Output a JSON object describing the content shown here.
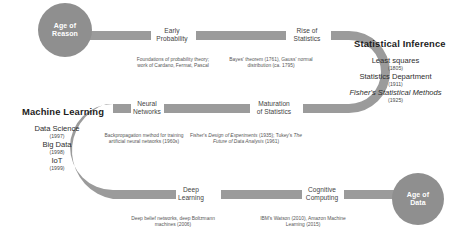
{
  "diagram": {
    "ribbon_color": "#9b9b9b",
    "endcap_color": "#8f8f8f",
    "background": "#ffffff",
    "text_color": "#3f3f3f",
    "endcaps": [
      {
        "id": "age-of-reason",
        "label": "Age of\nReason"
      },
      {
        "id": "age-of-data",
        "label": "Age of\nData"
      }
    ],
    "milestones": [
      {
        "id": "early-probability",
        "label": "Early\nProbability",
        "description": "Foundations of probability theory; work of Cardano, Fermat, Pascal"
      },
      {
        "id": "rise-of-statistics",
        "label": "Rise of\nStatistics",
        "description": "Bayes' theorem (1761), Gauss' normal distribution (ca. 1795)"
      },
      {
        "id": "maturation-of-statistics",
        "label": "Maturation\nof Statistics",
        "description_parts": [
          {
            "text": "Fisher's ",
            "style": "normal"
          },
          {
            "text": "Design of Experiments",
            "style": "italic"
          },
          {
            "text": " (1935); Tukey's ",
            "style": "normal"
          },
          {
            "text": "The Future of Data Analysis",
            "style": "italic"
          },
          {
            "text": " (1961)",
            "style": "normal"
          }
        ]
      },
      {
        "id": "neural-networks",
        "label": "Neural\nNetworks",
        "description": "Backpropagation method for training artificial neural networks (1960s)"
      },
      {
        "id": "deep-learning",
        "label": "Deep\nLearning",
        "description": "Deep belief networks, deep Boltzmann machines (2006)"
      },
      {
        "id": "cognitive-computing",
        "label": "Cognitive\nComputing",
        "description": "IBM's Watson (2010), Amazon Machine Learning (2015)"
      }
    ],
    "eras": [
      {
        "id": "statistical-inference",
        "title": "Statistical Inference",
        "entries": [
          {
            "name": "Least squares",
            "year": "(1805)"
          },
          {
            "name": "Statistics Department",
            "year": "(1911)"
          },
          {
            "name": "Fisher's Statistical Methods",
            "year": "(1925)",
            "style": "italic"
          }
        ]
      },
      {
        "id": "machine-learning",
        "title": "Machine Learning",
        "entries": [
          {
            "name": "Data Science",
            "year": "(1997)"
          },
          {
            "name": "Big Data",
            "year": "(1998)"
          },
          {
            "name": "IoT",
            "year": "(1999)"
          }
        ]
      }
    ]
  }
}
